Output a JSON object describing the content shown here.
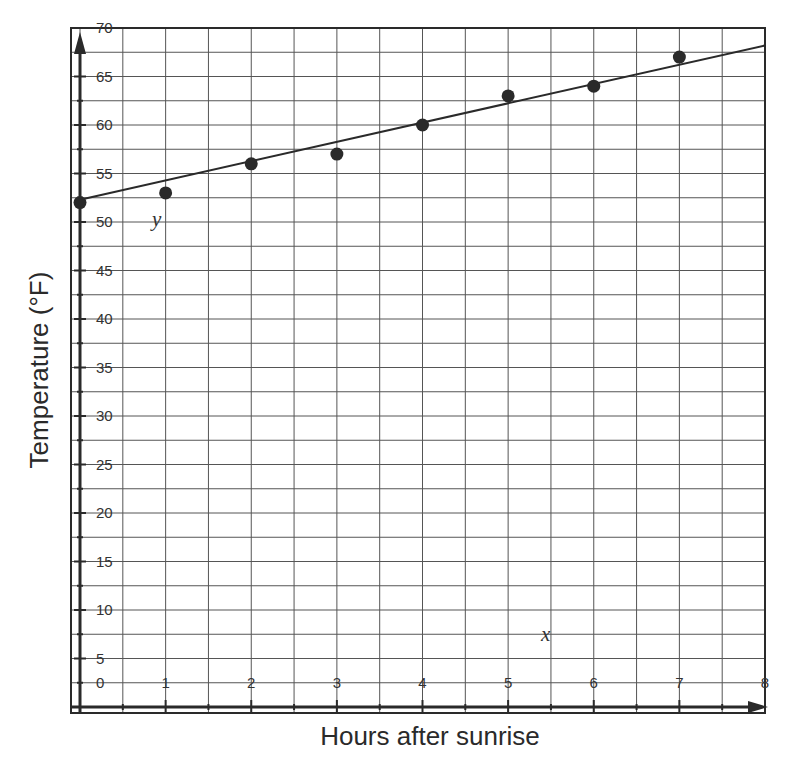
{
  "chart_data": {
    "type": "scatter",
    "title": "",
    "xlabel": "Hours after sunrise",
    "ylabel": "Temperature (°F)",
    "xlim": [
      0,
      8
    ],
    "ylim": [
      0,
      70
    ],
    "x_ticks": [
      1,
      2,
      3,
      4,
      5,
      6,
      7,
      8
    ],
    "y_ticks": [
      0,
      5,
      10,
      15,
      20,
      25,
      30,
      35,
      40,
      45,
      50,
      55,
      60,
      65,
      70
    ],
    "grid": true,
    "grid_step": {
      "x": 0.5,
      "y": 2.5
    },
    "axis_variable_labels": {
      "x": "x",
      "y": "y"
    },
    "series": [
      {
        "name": "Temperature readings",
        "type": "scatter",
        "x": [
          0,
          1,
          2,
          3,
          4,
          5,
          6,
          7
        ],
        "y": [
          52,
          53,
          56,
          57,
          60,
          63,
          64,
          67
        ]
      },
      {
        "name": "Line of best fit",
        "type": "line",
        "equation": "y = 2x + 52",
        "x": [
          0,
          8
        ],
        "y": [
          52.3,
          68.2
        ]
      }
    ],
    "legend": null
  },
  "colors": {
    "ink": "#2a2a2a",
    "grid": "#555555",
    "background": "#ffffff"
  }
}
